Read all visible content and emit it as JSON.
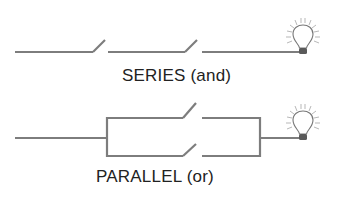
{
  "diagram": {
    "series": {
      "label": "SERIES (and)",
      "switches": 2,
      "icon": "lightbulb-icon"
    },
    "parallel": {
      "label": "PARALLEL (or)",
      "switches": 2,
      "icon": "lightbulb-icon"
    },
    "colors": {
      "wire": "#7d7d7d",
      "text": "#222222"
    }
  }
}
